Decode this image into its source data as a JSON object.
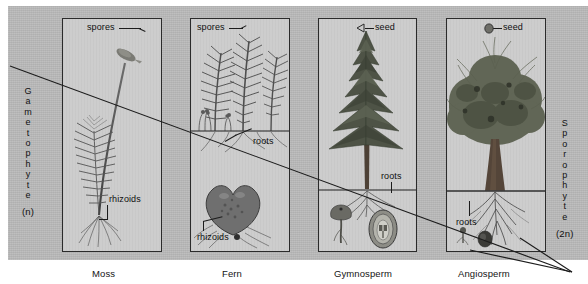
{
  "figure": {
    "background_color": "#b9b9b9",
    "panel_color": "#cdcdcd",
    "line_color": "#1c1c1c"
  },
  "left_axis": {
    "name": "Gametophyte",
    "letters": [
      "G",
      "a",
      "m",
      "e",
      "t",
      "o",
      "p",
      "h",
      "y",
      "t",
      "e"
    ],
    "ploidy": "(n)"
  },
  "right_axis": {
    "name": "Sporophyte",
    "letters": [
      "S",
      "p",
      "o",
      "r",
      "o",
      "p",
      "h",
      "y",
      "t",
      "e"
    ],
    "ploidy": "(2n)"
  },
  "panels": [
    {
      "id": "moss",
      "caption": "Moss",
      "labels": [
        {
          "text": "spores",
          "name": "label-spores"
        },
        {
          "text": "rhizoids",
          "name": "label-rhizoids"
        }
      ]
    },
    {
      "id": "fern",
      "caption": "Fern",
      "labels": [
        {
          "text": "spores",
          "name": "label-spores"
        },
        {
          "text": "roots",
          "name": "label-roots"
        },
        {
          "text": "rhizoids",
          "name": "label-rhizoids"
        }
      ]
    },
    {
      "id": "gymnosperm",
      "caption": "Gymnosperm",
      "labels": [
        {
          "text": "seed",
          "name": "label-seed"
        },
        {
          "text": "roots",
          "name": "label-roots"
        }
      ]
    },
    {
      "id": "angiosperm",
      "caption": "Angiosperm",
      "labels": [
        {
          "text": "seed",
          "name": "label-seed"
        },
        {
          "text": "roots",
          "name": "label-roots"
        }
      ]
    }
  ]
}
